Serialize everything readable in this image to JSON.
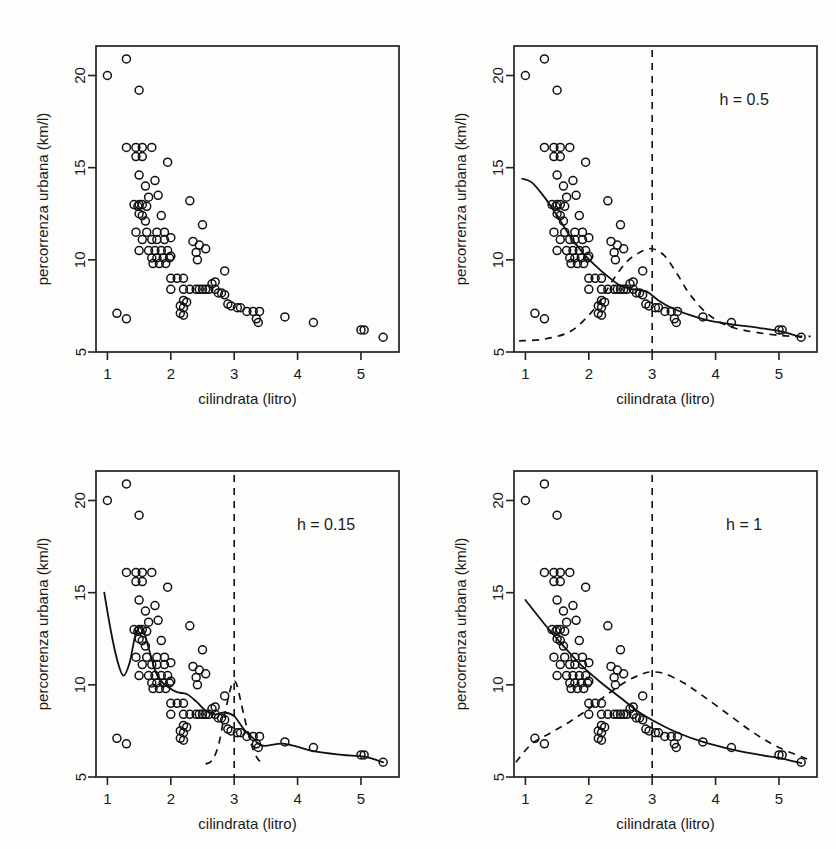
{
  "figure": {
    "panel_count": 4,
    "width": 836,
    "height": 849
  },
  "axes": {
    "xlabel": "cilindrata (litro)",
    "ylabel": "percorrenza urbana (km/l)",
    "xticks": [
      "1",
      "2",
      "3",
      "4",
      "5"
    ],
    "xtick_values": [
      1,
      2,
      3,
      4,
      5
    ],
    "yticks": [
      "5",
      "10",
      "15",
      "20"
    ],
    "ytick_values": [
      5,
      10,
      15,
      20
    ],
    "xlim": [
      0.82,
      5.6
    ],
    "ylim": [
      5.0,
      21.6
    ]
  },
  "panels": [
    {
      "id": "panel-1",
      "h_label": "",
      "has_fit": false,
      "has_kernel": false,
      "has_vline": false
    },
    {
      "id": "panel-2",
      "h_label": "h = 0.5",
      "has_fit": true,
      "has_kernel": true,
      "has_vline": true,
      "x0": 3
    },
    {
      "id": "panel-3",
      "h_label": "h = 0.15",
      "has_fit": true,
      "has_kernel": true,
      "has_vline": true,
      "x0": 3
    },
    {
      "id": "panel-4",
      "h_label": "h = 1",
      "has_fit": true,
      "has_kernel": true,
      "has_vline": true,
      "x0": 3
    }
  ],
  "colors": {
    "ink": "#111111",
    "frame": "#222222",
    "background": "#fdfdfc"
  },
  "chart_data": {
    "type": "scatter",
    "title": "",
    "xlabel": "cilindrata (litro)",
    "ylabel": "percorrenza urbana (km/l)",
    "xlim": [
      0.82,
      5.6
    ],
    "ylim": [
      5.0,
      21.6
    ],
    "grid": false,
    "legend": false,
    "annotations": [
      "h = 0.5",
      "h = 0.15",
      "h = 1"
    ],
    "points": [
      [
        1.0,
        20.0
      ],
      [
        1.3,
        20.9
      ],
      [
        1.5,
        19.2
      ],
      [
        1.3,
        16.1
      ],
      [
        1.45,
        16.1
      ],
      [
        1.55,
        16.1
      ],
      [
        1.7,
        16.1
      ],
      [
        1.45,
        15.6
      ],
      [
        1.55,
        15.6
      ],
      [
        1.95,
        15.3
      ],
      [
        1.5,
        14.6
      ],
      [
        1.6,
        14.0
      ],
      [
        1.75,
        14.3
      ],
      [
        1.65,
        13.4
      ],
      [
        1.8,
        13.5
      ],
      [
        1.5,
        13.0
      ],
      [
        1.42,
        13.0
      ],
      [
        1.55,
        13.0
      ],
      [
        1.48,
        12.9
      ],
      [
        1.62,
        12.9
      ],
      [
        2.3,
        13.2
      ],
      [
        1.5,
        12.5
      ],
      [
        1.55,
        12.4
      ],
      [
        1.85,
        12.4
      ],
      [
        1.6,
        12.1
      ],
      [
        1.45,
        11.5
      ],
      [
        1.62,
        11.5
      ],
      [
        1.78,
        11.5
      ],
      [
        1.9,
        11.5
      ],
      [
        2.5,
        11.9
      ],
      [
        1.55,
        11.1
      ],
      [
        1.7,
        11.1
      ],
      [
        1.78,
        11.1
      ],
      [
        1.9,
        11.1
      ],
      [
        2.0,
        11.2
      ],
      [
        2.35,
        11.0
      ],
      [
        2.45,
        10.8
      ],
      [
        1.5,
        10.5
      ],
      [
        1.65,
        10.5
      ],
      [
        1.75,
        10.5
      ],
      [
        1.85,
        10.5
      ],
      [
        1.95,
        10.5
      ],
      [
        2.4,
        10.4
      ],
      [
        2.55,
        10.6
      ],
      [
        1.7,
        10.1
      ],
      [
        1.78,
        10.1
      ],
      [
        1.88,
        10.1
      ],
      [
        1.98,
        10.1
      ],
      [
        2.0,
        10.2
      ],
      [
        2.42,
        10.0
      ],
      [
        2.85,
        9.4
      ],
      [
        1.72,
        9.8
      ],
      [
        1.82,
        9.8
      ],
      [
        1.92,
        9.8
      ],
      [
        2.0,
        9.0
      ],
      [
        2.1,
        9.0
      ],
      [
        2.2,
        9.0
      ],
      [
        2.0,
        8.4
      ],
      [
        2.2,
        8.4
      ],
      [
        2.3,
        8.4
      ],
      [
        2.4,
        8.4
      ],
      [
        2.45,
        8.4
      ],
      [
        2.5,
        8.4
      ],
      [
        2.55,
        8.4
      ],
      [
        2.6,
        8.4
      ],
      [
        2.65,
        8.7
      ],
      [
        2.7,
        8.8
      ],
      [
        2.7,
        8.4
      ],
      [
        2.75,
        8.2
      ],
      [
        2.8,
        8.2
      ],
      [
        2.85,
        8.1
      ],
      [
        2.2,
        7.8
      ],
      [
        2.25,
        7.7
      ],
      [
        2.15,
        7.5
      ],
      [
        2.2,
        7.4
      ],
      [
        2.15,
        7.1
      ],
      [
        2.2,
        7.0
      ],
      [
        2.9,
        7.6
      ],
      [
        2.95,
        7.5
      ],
      [
        3.05,
        7.4
      ],
      [
        3.1,
        7.4
      ],
      [
        3.2,
        7.2
      ],
      [
        3.3,
        7.2
      ],
      [
        3.4,
        7.2
      ],
      [
        3.35,
        6.8
      ],
      [
        3.38,
        6.6
      ],
      [
        1.15,
        7.1
      ],
      [
        1.3,
        6.8
      ],
      [
        3.8,
        6.9
      ],
      [
        4.25,
        6.6
      ],
      [
        5.0,
        6.2
      ],
      [
        5.05,
        6.2
      ],
      [
        5.35,
        5.8
      ]
    ],
    "series": [
      {
        "name": "kernel regression fit (h = 0.5)",
        "panel": "panel-2",
        "style": "solid",
        "x": [
          0.95,
          1.1,
          1.3,
          1.5,
          1.7,
          1.9,
          2.1,
          2.3,
          2.5,
          2.7,
          2.9,
          3.1,
          3.3,
          3.6,
          3.9,
          4.25,
          4.7,
          5.05,
          5.35
        ],
        "y": [
          14.4,
          14.2,
          13.4,
          12.4,
          11.3,
          10.4,
          9.7,
          9.1,
          8.6,
          8.4,
          8.3,
          7.8,
          7.4,
          7.0,
          6.7,
          6.5,
          6.3,
          6.1,
          5.8
        ]
      },
      {
        "name": "kernel weights (h = 0.5) centered at x0 = 3",
        "panel": "panel-2",
        "style": "dashed",
        "x": [
          0.9,
          1.3,
          1.7,
          2.0,
          2.2,
          2.4,
          2.6,
          2.8,
          3.0,
          3.2,
          3.4,
          3.6,
          3.9,
          4.3,
          5.0,
          5.5
        ],
        "y": [
          5.6,
          5.7,
          6.1,
          7.0,
          7.9,
          9.0,
          9.9,
          10.4,
          10.6,
          10.2,
          9.2,
          8.1,
          7.0,
          6.3,
          5.9,
          5.85
        ]
      },
      {
        "name": "kernel regression fit (h = 0.15)",
        "panel": "panel-3",
        "style": "solid",
        "x": [
          0.95,
          1.05,
          1.15,
          1.25,
          1.35,
          1.45,
          1.55,
          1.65,
          1.75,
          1.85,
          1.95,
          2.1,
          2.25,
          2.4,
          2.55,
          2.7,
          2.85,
          3.0,
          3.15,
          3.3,
          3.45,
          3.8,
          4.25,
          4.7,
          5.05,
          5.35
        ],
        "y": [
          15.0,
          13.0,
          11.4,
          10.5,
          11.2,
          12.8,
          13.1,
          12.0,
          10.8,
          10.2,
          9.9,
          9.6,
          9.5,
          9.1,
          8.6,
          8.4,
          8.5,
          8.3,
          7.6,
          7.1,
          6.7,
          6.8,
          6.4,
          6.2,
          6.1,
          5.8
        ]
      },
      {
        "name": "kernel weights (h = 0.15) centered at x0 = 3",
        "panel": "panel-3",
        "style": "dashed",
        "x": [
          2.55,
          2.65,
          2.75,
          2.85,
          2.95,
          3.0,
          3.05,
          3.15,
          3.25,
          3.35,
          3.45
        ],
        "y": [
          5.7,
          5.9,
          6.7,
          8.4,
          9.9,
          10.2,
          9.9,
          8.4,
          7.0,
          6.1,
          5.7
        ]
      },
      {
        "name": "kernel regression fit (h = 1)",
        "panel": "panel-4",
        "style": "solid",
        "x": [
          1.0,
          1.3,
          1.6,
          1.9,
          2.2,
          2.5,
          2.8,
          3.1,
          3.4,
          3.8,
          4.25,
          4.7,
          5.05,
          5.35
        ],
        "y": [
          14.6,
          13.3,
          12.1,
          11.0,
          10.1,
          9.3,
          8.5,
          7.9,
          7.4,
          6.9,
          6.5,
          6.2,
          6.0,
          5.75
        ]
      },
      {
        "name": "kernel weights (h = 1) centered at x0 = 3",
        "panel": "panel-4",
        "style": "dashed",
        "x": [
          0.85,
          1.1,
          1.4,
          1.7,
          2.0,
          2.3,
          2.6,
          2.85,
          3.0,
          3.2,
          3.5,
          3.8,
          4.2,
          4.6,
          5.0,
          5.5
        ],
        "y": [
          5.8,
          6.8,
          7.4,
          8.0,
          8.7,
          9.5,
          10.2,
          10.6,
          10.7,
          10.6,
          10.1,
          9.4,
          8.4,
          7.4,
          6.6,
          5.9
        ]
      }
    ]
  }
}
